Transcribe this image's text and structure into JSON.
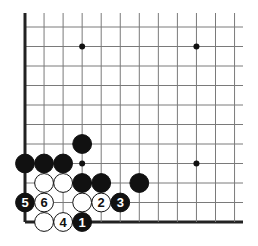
{
  "diagram": {
    "type": "go-board-corner",
    "columns": 12,
    "rows": 11,
    "edges": [
      "left",
      "bottom"
    ],
    "colors": {
      "line": "#7a7a7a",
      "edge": "#222222",
      "black": "#111111",
      "white": "#ffffff"
    },
    "star_points": [
      {
        "col": 3,
        "row": 1
      },
      {
        "col": 9,
        "row": 1
      },
      {
        "col": 3,
        "row": 7
      },
      {
        "col": 9,
        "row": 7
      }
    ],
    "stones": [
      {
        "color": "black",
        "col": 3,
        "row": 6,
        "label": ""
      },
      {
        "color": "black",
        "col": 0,
        "row": 7,
        "label": ""
      },
      {
        "color": "black",
        "col": 1,
        "row": 7,
        "label": ""
      },
      {
        "color": "black",
        "col": 2,
        "row": 7,
        "label": ""
      },
      {
        "color": "white",
        "col": 1,
        "row": 8,
        "label": ""
      },
      {
        "color": "white",
        "col": 2,
        "row": 8,
        "label": ""
      },
      {
        "color": "black",
        "col": 3,
        "row": 8,
        "label": ""
      },
      {
        "color": "black",
        "col": 4,
        "row": 8,
        "label": ""
      },
      {
        "color": "black",
        "col": 6,
        "row": 8,
        "label": ""
      },
      {
        "color": "black",
        "col": 0,
        "row": 9,
        "label": "5"
      },
      {
        "color": "white",
        "col": 1,
        "row": 9,
        "label": "6"
      },
      {
        "color": "white",
        "col": 3,
        "row": 9,
        "label": ""
      },
      {
        "color": "white",
        "col": 4,
        "row": 9,
        "label": "2"
      },
      {
        "color": "black",
        "col": 5,
        "row": 9,
        "label": "3"
      },
      {
        "color": "white",
        "col": 1,
        "row": 10,
        "label": ""
      },
      {
        "color": "white",
        "col": 2,
        "row": 10,
        "label": "4"
      },
      {
        "color": "black",
        "col": 3,
        "row": 10,
        "label": "1"
      }
    ]
  }
}
